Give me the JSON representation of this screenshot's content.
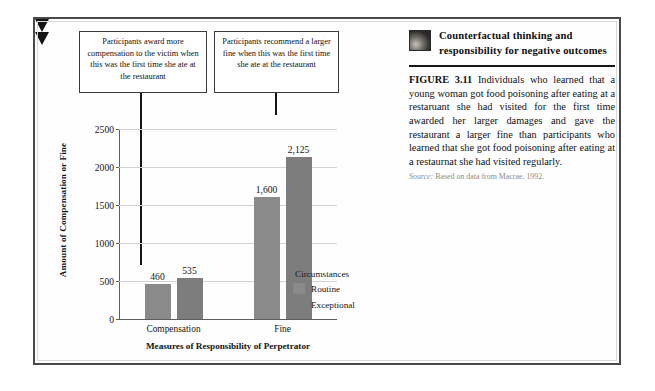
{
  "figure": {
    "header_title": "Counterfactual thinking and responsibility for negative outcomes",
    "thumbnail_name": "restaurant-photo-thumbnail",
    "figure_label": "FIGURE 3.11",
    "caption_body": "Individuals who learned that a young woman got food poisoning after eating at a restaruant she had visited for the first time awarded her larger damages and gave the restaurant a larger fine than participants who learned that she got food poisoning after eating at a restaurnat she had visited regularly.",
    "source_prefix": "Source:",
    "source_text": "Based on data from Macrae, 1992."
  },
  "callouts": [
    {
      "id": "callout-compensation",
      "text": "Participants award more compensation to the victim when this was the first time she ate at the restaurant"
    },
    {
      "id": "callout-fine",
      "text": "Participants recommend a larger fine when this was the first time she ate at the restaurant"
    }
  ],
  "colors": {
    "bar_routine": "#8a8a8a",
    "bar_exceptional": "#7d7d7d",
    "gridline": "#d2d2d2",
    "axis": "#5d5d5d",
    "arrow": "#141414",
    "frame": "#4a4a4e"
  },
  "chart_data": {
    "type": "bar",
    "title": "",
    "xlabel": "Measures of Responsibility of Perpetrator",
    "ylabel": "Amount of Compensation or Fine",
    "categories": [
      "Compensation",
      "Fine"
    ],
    "series": [
      {
        "name": "Routine",
        "values": [
          460,
          1600
        ],
        "color": "#8a8a8a"
      },
      {
        "name": "Exceptional",
        "values": [
          535,
          2125
        ],
        "color": "#7d7d7d"
      }
    ],
    "value_labels": [
      [
        "460",
        "1,600"
      ],
      [
        "535",
        "2,125"
      ]
    ],
    "legend_title": "Circumstances",
    "legend_position": "right",
    "ylim": [
      0,
      2500
    ],
    "yticks": [
      0,
      500,
      1000,
      1500,
      2000,
      2500
    ],
    "ytick_labels": [
      "0",
      "500",
      "1000",
      "1500",
      "2000",
      "2500"
    ],
    "grid": true
  }
}
